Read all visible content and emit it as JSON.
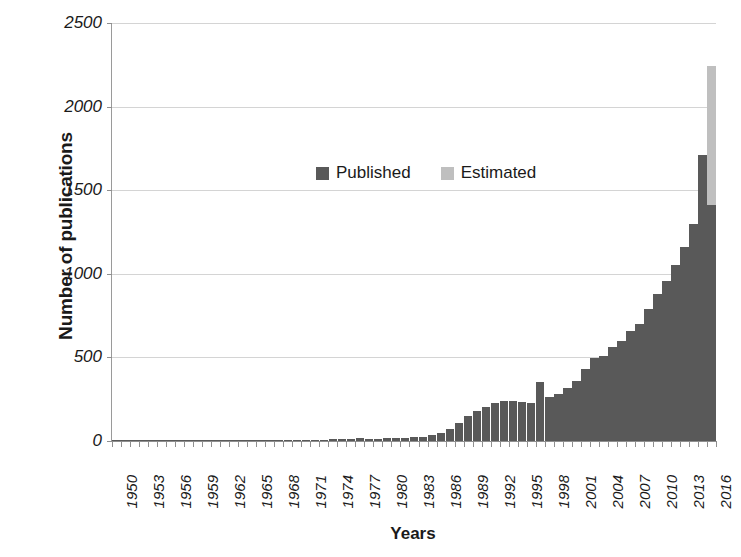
{
  "chart_data": {
    "type": "bar",
    "title": "",
    "xlabel": "Years",
    "ylabel": "Number of publications",
    "ylim": [
      0,
      2500
    ],
    "ytick_values": [
      0,
      500,
      1000,
      1500,
      2000,
      2500
    ],
    "ytick_labels": [
      "0",
      "500",
      "1000",
      "1500",
      "2000",
      "2500"
    ],
    "grid": "horizontal",
    "stacked": true,
    "legend_position": "inside-upper-left",
    "legend": [
      {
        "name": "Published",
        "color": "#595959"
      },
      {
        "name": "Estimated",
        "color": "#bfbfbf"
      }
    ],
    "xtick_label_step": 3,
    "categories": [
      "1950",
      "1951",
      "1952",
      "1953",
      "1954",
      "1955",
      "1956",
      "1957",
      "1958",
      "1959",
      "1960",
      "1961",
      "1962",
      "1963",
      "1964",
      "1965",
      "1966",
      "1967",
      "1968",
      "1969",
      "1970",
      "1971",
      "1972",
      "1973",
      "1974",
      "1975",
      "1976",
      "1977",
      "1978",
      "1979",
      "1980",
      "1981",
      "1982",
      "1983",
      "1984",
      "1985",
      "1986",
      "1987",
      "1988",
      "1989",
      "1990",
      "1991",
      "1992",
      "1993",
      "1994",
      "1995",
      "1996",
      "1997",
      "1998",
      "1999",
      "2000",
      "2001",
      "2002",
      "2003",
      "2004",
      "2005",
      "2006",
      "2007",
      "2008",
      "2009",
      "2010",
      "2011",
      "2012",
      "2013",
      "2014",
      "2015",
      "2016"
    ],
    "series": [
      {
        "name": "Published",
        "color": "#595959",
        "values": [
          1,
          1,
          1,
          2,
          1,
          2,
          2,
          2,
          2,
          3,
          2,
          3,
          3,
          3,
          4,
          4,
          4,
          5,
          5,
          6,
          6,
          7,
          8,
          9,
          10,
          12,
          14,
          16,
          15,
          14,
          16,
          18,
          20,
          22,
          26,
          34,
          48,
          72,
          110,
          150,
          180,
          205,
          228,
          238,
          242,
          235,
          228,
          350,
          262,
          282,
          320,
          360,
          430,
          498,
          510,
          560,
          600,
          660,
          700,
          790,
          880,
          960,
          1050,
          1160,
          1300,
          1710,
          1410
        ]
      },
      {
        "name": "Estimated",
        "color": "#bfbfbf",
        "values": [
          0,
          0,
          0,
          0,
          0,
          0,
          0,
          0,
          0,
          0,
          0,
          0,
          0,
          0,
          0,
          0,
          0,
          0,
          0,
          0,
          0,
          0,
          0,
          0,
          0,
          0,
          0,
          0,
          0,
          0,
          0,
          0,
          0,
          0,
          0,
          0,
          0,
          0,
          0,
          0,
          0,
          0,
          0,
          0,
          0,
          0,
          0,
          0,
          0,
          0,
          0,
          0,
          0,
          0,
          0,
          0,
          0,
          0,
          0,
          0,
          0,
          0,
          0,
          0,
          0,
          0,
          830
        ]
      }
    ]
  },
  "axes": {
    "y_title": "Number of publications",
    "x_title": "Years"
  }
}
